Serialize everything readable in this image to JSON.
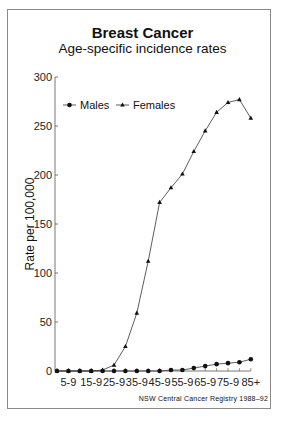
{
  "chart_data": {
    "type": "line",
    "title": "Breast Cancer",
    "subtitle": "Age-specific incidence rates",
    "xlabel": "",
    "ylabel": "Rate per 100,000",
    "ylim": [
      0,
      300
    ],
    "yticks": [
      0,
      50,
      100,
      150,
      200,
      250,
      300
    ],
    "categories": [
      "0-4",
      "5-9",
      "10-14",
      "15-19",
      "20-24",
      "25-29",
      "30-34",
      "35-39",
      "40-44",
      "45-49",
      "50-54",
      "55-59",
      "60-64",
      "65-69",
      "70-74",
      "75-79",
      "80-84",
      "85+"
    ],
    "xtick_labels": [
      "5-9",
      "15-9",
      "25-9",
      "35-9",
      "45-9",
      "55-9",
      "65-9",
      "75-9",
      "85+"
    ],
    "grid": false,
    "legend_position": "upper-left",
    "series": [
      {
        "name": "Males",
        "marker": "circle",
        "values": [
          0,
          0,
          0,
          0,
          0,
          0,
          0,
          0,
          0,
          0,
          1,
          1,
          3,
          5,
          7,
          8,
          9,
          12
        ]
      },
      {
        "name": "Females",
        "marker": "triangle",
        "values": [
          0,
          0,
          0,
          0,
          1,
          6,
          25,
          59,
          112,
          172,
          187,
          201,
          224,
          245,
          264,
          274,
          277,
          258
        ]
      }
    ],
    "source": "NSW Central Cancer Registry 1988–92"
  },
  "header": {
    "title": "Breast Cancer",
    "subtitle": "Age-specific incidence rates"
  },
  "axis": {
    "ylabel": "Rate per 100,000"
  },
  "legend": {
    "males": "Males",
    "females": "Females"
  },
  "footer": {
    "source": "NSW Central Cancer Registry 1988–92"
  }
}
